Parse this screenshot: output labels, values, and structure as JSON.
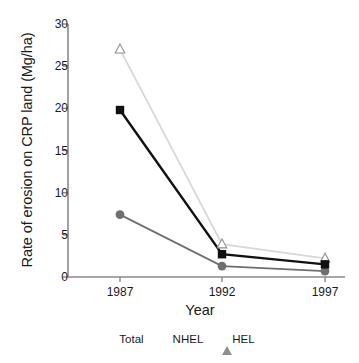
{
  "chart_data": {
    "type": "line",
    "title": "",
    "xlabel": "Year",
    "ylabel": "Rate of erosion on CRP land (Mg/ha)",
    "categories": [
      "1987",
      "1992",
      "1997"
    ],
    "x": [
      1987,
      1992,
      1997
    ],
    "xlim": [
      1985.5,
      1998.5
    ],
    "ylim": [
      0,
      30
    ],
    "yticks": [
      "0",
      "5",
      "10",
      "15",
      "20",
      "25",
      "30"
    ],
    "ytick_values": [
      0,
      5,
      10,
      15,
      20,
      25,
      30
    ],
    "grid": false,
    "legend_position": "bottom",
    "series": [
      {
        "name": "Total",
        "marker": "square",
        "color": "#111111",
        "values": [
          19.8,
          2.7,
          1.5
        ]
      },
      {
        "name": "NHEL",
        "marker": "circle",
        "color": "#6f6f6f",
        "values": [
          7.4,
          1.3,
          0.7
        ]
      },
      {
        "name": "HEL",
        "marker": "triangle",
        "color": "#d8d8d8",
        "values": [
          27.0,
          3.9,
          2.2
        ]
      }
    ]
  },
  "legend": {
    "items": [
      {
        "label": "Total",
        "marker": "square-marker-icon"
      },
      {
        "label": "NHEL",
        "marker": "circle-marker-icon"
      },
      {
        "label": "HEL",
        "marker": "triangle-marker-icon"
      }
    ]
  },
  "axis_colors": {
    "axis_line": "#8a8a8a",
    "tick": "#8a8a8a",
    "text": "#1a1a1a"
  }
}
